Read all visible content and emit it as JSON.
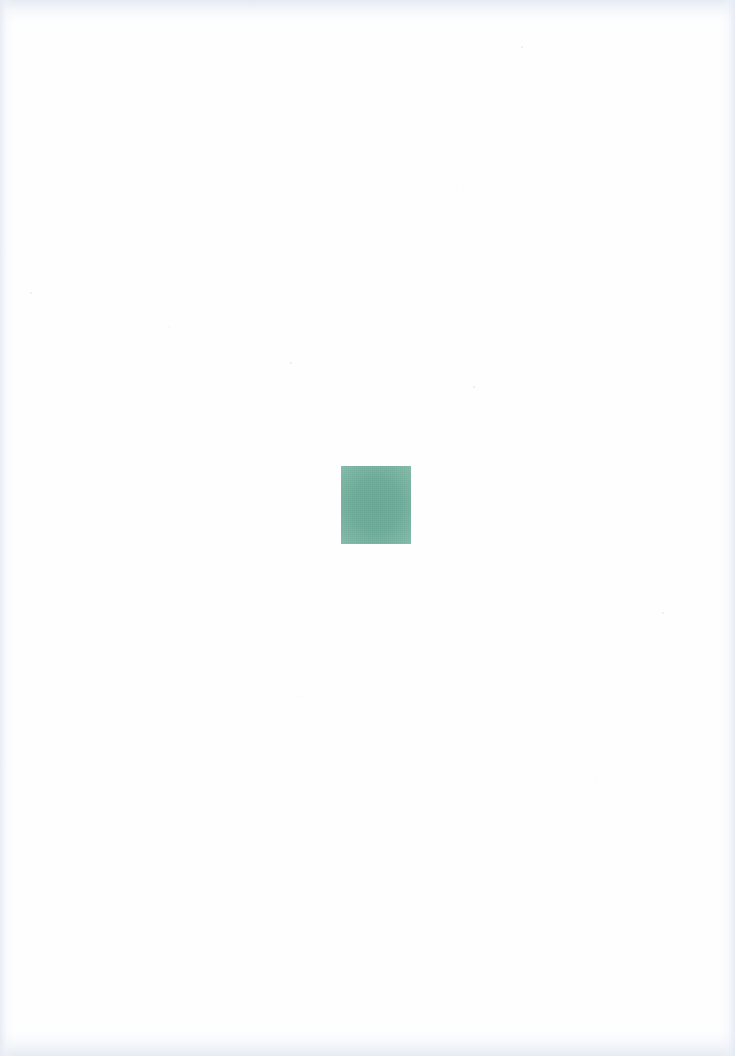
{
  "page": {
    "width": 735,
    "height": 1056,
    "background_color": "#fefeff",
    "paper_tone": "near-white with faint cool-grey scanner vignette at edges",
    "visible_text": "",
    "text_present": "none"
  },
  "swatch": {
    "name": "green color swatch",
    "shape": "rectangle",
    "label": "",
    "fill_color": "#6faf9b",
    "edge_color": "#7cb6a3",
    "x": 341,
    "y": 466,
    "width": 70,
    "height": 78,
    "center_x": 376,
    "center_y": 505,
    "texture": "flat matte ink with fine paper grain"
  },
  "vignette": {
    "top_color": "#e4e9f1",
    "bottom_color": "#e5eaf1",
    "left_color": "#e6eaf2",
    "right_color": "#e5eaf2"
  },
  "specks": [
    {
      "x": 290,
      "y": 362,
      "size": 2
    },
    {
      "x": 473,
      "y": 386,
      "size": 2
    },
    {
      "x": 30,
      "y": 292,
      "size": 2
    },
    {
      "x": 521,
      "y": 46,
      "size": 2
    },
    {
      "x": 662,
      "y": 612,
      "size": 2
    }
  ]
}
